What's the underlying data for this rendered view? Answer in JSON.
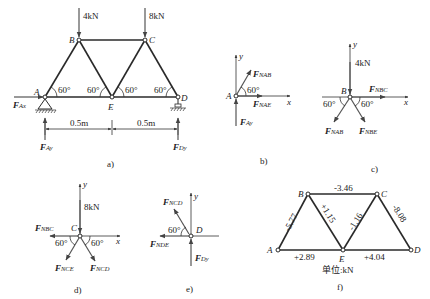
{
  "figure": {
    "panels": {
      "a": {
        "caption": "a)",
        "nodes": [
          "A",
          "B",
          "C",
          "D",
          "E"
        ],
        "loads": {
          "B": "4kN",
          "C": "8kN"
        },
        "angles": [
          "60°",
          "60°",
          "60°",
          "60°"
        ],
        "dimensions": [
          "0.5m",
          "0.5m"
        ],
        "reactions": {
          "Ax": "F",
          "Ax_sub": "Ax",
          "Ay": "F",
          "Ay_sub": "Ay",
          "Dy": "F",
          "Dy_sub": "Dy"
        }
      },
      "b": {
        "caption": "b)",
        "node": "A",
        "axes": {
          "x": "x",
          "y": "y"
        },
        "angle": "60°",
        "forces": {
          "NAB": "NAB",
          "NAE": "NAE",
          "Ay": "Ay"
        }
      },
      "c": {
        "caption": "c)",
        "node": "B",
        "axes": {
          "x": "x",
          "y": "y"
        },
        "load": "4kN",
        "angles": [
          "60°",
          "60°"
        ],
        "forces": {
          "NBC": "NBC",
          "NAB": "NAB",
          "NBE": "NBE"
        }
      },
      "d": {
        "caption": "d)",
        "node": "C",
        "axes": {
          "x": "x",
          "y": "y"
        },
        "load": "8kN",
        "angles": [
          "60°",
          "60°"
        ],
        "forces": {
          "NBC": "NBC",
          "NCE": "NCE",
          "NCD": "NCD"
        }
      },
      "e": {
        "caption": "e)",
        "node": "D",
        "axes": {
          "x": "x",
          "y": "y"
        },
        "angle": "60°",
        "forces": {
          "NCD": "NCD",
          "NDE": "NDE",
          "Dy": "Dy"
        }
      },
      "f": {
        "caption": "f)",
        "nodes": [
          "A",
          "B",
          "C",
          "D",
          "E"
        ],
        "member_forces": {
          "AB": "-5.77",
          "BC": "-3.46",
          "BE": "+1.15",
          "CE": "-1.16",
          "CD": "-8.08",
          "AE": "+2.89",
          "ED": "+4.04"
        },
        "unit_label": "单位:kN"
      }
    },
    "force_symbol": "F"
  }
}
